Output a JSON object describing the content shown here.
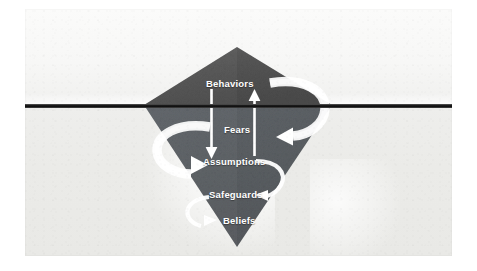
{
  "diagram": {
    "type": "iceberg-model",
    "shape": "inverted-diamond",
    "waterline_label": "",
    "colors": {
      "berg_above_water": "#555555",
      "berg_below_water": "#5b5f63",
      "waterline": "#141414",
      "sky": "#f8f8f7",
      "water": "#ebebe8",
      "label_text": "#ffffff",
      "arrow": "#ffffff"
    },
    "levels": [
      {
        "id": "behaviors",
        "label": "Behaviors",
        "position": "above-waterline"
      },
      {
        "id": "fears",
        "label": "Fears",
        "position": "below-waterline"
      },
      {
        "id": "assumptions",
        "label": "Assumptions",
        "position": "below-waterline"
      },
      {
        "id": "safeguards",
        "label": "Safeguards",
        "position": "below-waterline"
      },
      {
        "id": "beliefs",
        "label": "Beliefs",
        "position": "below-waterline"
      }
    ],
    "arrows": [
      {
        "id": "behaviors-to-assumptions",
        "from": "Behaviors",
        "to": "Assumptions",
        "style": "straight-down"
      },
      {
        "id": "assumptions-to-behaviors",
        "from": "Assumptions",
        "to": "Behaviors",
        "style": "straight-up"
      },
      {
        "id": "behaviors-loop-fears",
        "from": "Behaviors",
        "to": "Fears",
        "style": "curved-clockwise-right"
      },
      {
        "id": "fears-loop-assumptions",
        "from": "Fears",
        "to": "Assumptions",
        "style": "curved-clockwise-left"
      },
      {
        "id": "assumptions-to-safeguards",
        "from": "Assumptions",
        "to": "Safeguards",
        "style": "curved-right"
      },
      {
        "id": "beliefs-to-safeguards",
        "from": "Beliefs",
        "to": "Safeguards",
        "style": "curved-left"
      }
    ]
  }
}
